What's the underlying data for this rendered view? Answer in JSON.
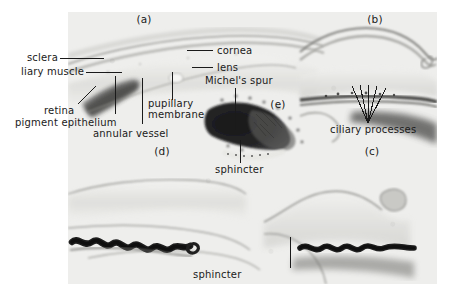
{
  "figure": {
    "kind": "histology-micrograph-plate",
    "panel_count": 5,
    "background_color": "#ffffff",
    "plate_color": "#eeeeec",
    "text_color": "#1a1a1a"
  },
  "panel_ids": [
    {
      "key": "a",
      "label": "(a)"
    },
    {
      "key": "b",
      "label": "(b)"
    },
    {
      "key": "c",
      "label": "(c)"
    },
    {
      "key": "d",
      "label": "(d)"
    },
    {
      "key": "e",
      "label": "(e)"
    }
  ],
  "annotations": {
    "sclera": "sclera",
    "ciliary_muscle": "liary muscle",
    "retina": "retina",
    "pigment_epithelium": "pigment epithelium",
    "annular_vessel": "annular  vessel",
    "pupillary_membrane_line1": "pupillary",
    "pupillary_membrane_line2": "membrane",
    "cornea": "cornea",
    "lens": "lens",
    "michels_spur": "Michel's spur",
    "ciliary_processes": "ciliary  processes",
    "sphincter_e": "sphincter",
    "sphincter_d": "sphincter"
  }
}
